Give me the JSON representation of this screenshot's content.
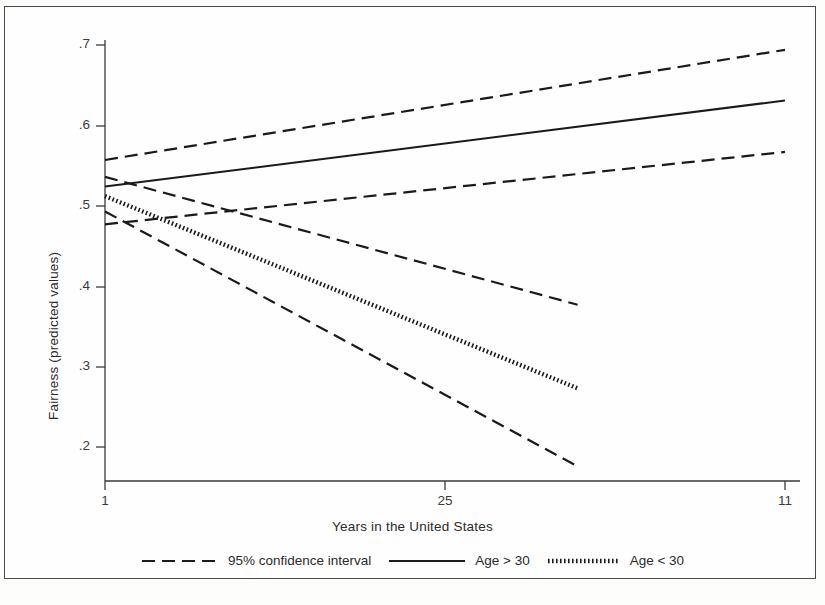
{
  "chart_data": {
    "type": "line",
    "title": "",
    "xlabel": "Years in the United States",
    "ylabel": "Fairness (predicted values)",
    "xlim": [
      1,
      11
    ],
    "ylim": [
      0.155,
      0.715
    ],
    "grid": false,
    "legend_position": "bottom",
    "xticks": [
      {
        "value": 1,
        "label": "1",
        "px": 105
      },
      {
        "value": 6,
        "label": "25",
        "px": 445
      },
      {
        "value": 11,
        "label": "11",
        "px": 785
      }
    ],
    "yticks": [
      {
        "value": 0.7,
        "label": ".7",
        "px": 45
      },
      {
        "value": 0.6,
        "label": ".6",
        "px": 126
      },
      {
        "value": 0.5,
        "label": ".5",
        "px": 206
      },
      {
        "value": 0.4,
        "label": ".4",
        "px": 287
      },
      {
        "value": 0.3,
        "label": ".3",
        "px": 367
      },
      {
        "value": 0.2,
        "label": ".2",
        "px": 447
      }
    ],
    "series": [
      {
        "name": "Age > 30",
        "style": "solid",
        "x": [
          1,
          11
        ],
        "values": [
          0.524,
          0.631
        ]
      },
      {
        "name": "Age > 30 upper 95% CI",
        "style": "dashed",
        "x": [
          1,
          11
        ],
        "values": [
          0.557,
          0.694
        ]
      },
      {
        "name": "Age > 30 lower 95% CI",
        "style": "dashed",
        "x": [
          1,
          11
        ],
        "values": [
          0.477,
          0.567
        ]
      },
      {
        "name": "Age < 30",
        "style": "dotted",
        "x": [
          1,
          7.95
        ],
        "values": [
          0.512,
          0.273
        ]
      },
      {
        "name": "Age < 30 upper 95% CI",
        "style": "dashed",
        "x": [
          1,
          7.95
        ],
        "values": [
          0.536,
          0.377
        ]
      },
      {
        "name": "Age < 30 lower 95% CI",
        "style": "dashed",
        "x": [
          1,
          7.95
        ],
        "values": [
          0.493,
          0.176
        ]
      }
    ],
    "legend": [
      {
        "label": "95% confidence interval",
        "style": "dashed"
      },
      {
        "label": "Age > 30",
        "style": "solid"
      },
      {
        "label": "Age < 30",
        "style": "dotted"
      }
    ],
    "colors": {
      "line": "#1a1a1a",
      "axis": "#3a3a3a",
      "background": "#fefefe",
      "frame": "#4a4a4a"
    }
  }
}
